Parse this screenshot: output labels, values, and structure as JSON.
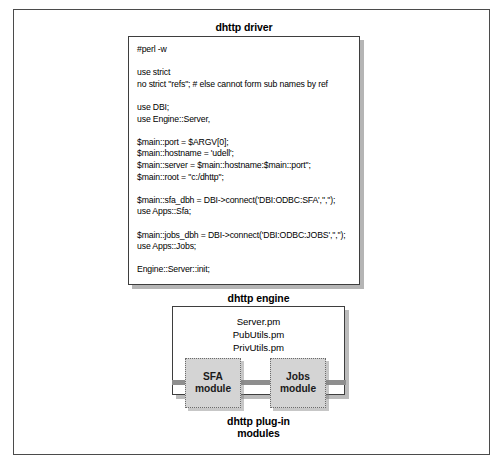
{
  "figure": {
    "driver": {
      "caption": "dhttp driver",
      "code": "#perl -w\n\nuse strict\nno strict \"refs\"; # else cannot form sub names by ref\n\nuse DBI;\nuse Engine::Server,\n\n$main::port = $ARGV[0];\n$main::hostname = 'udell';\n$main::server = $main::hostname:$main::port\";\n$main::root = \"c:/dhttp\";\n\n$main::sfa_dbh = DBI->connect('DBI:ODBC:SFA','','');\nuse Apps::Sfa;\n\n$main::jobs_dbh = DBI->connect('DBI:ODBC:JOBS','','');\nuse Apps::Jobs;\n\nEngine::Server::init;"
    },
    "engine": {
      "caption": "dhttp engine",
      "modules": "Server.pm\nPubUtils.pm\nPrivUtils.pm"
    },
    "plugins": {
      "caption": "dhttp plug-in\nmodules",
      "boxes": [
        {
          "label": "SFA\nmodule"
        },
        {
          "label": "Jobs\nmodule"
        }
      ]
    }
  }
}
